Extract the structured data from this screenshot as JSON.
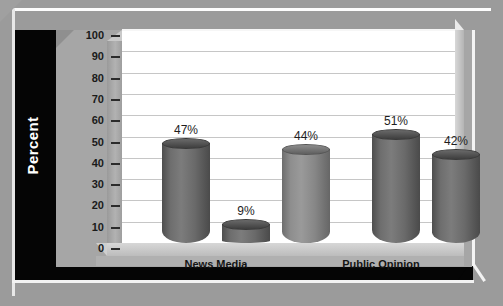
{
  "chart_data": {
    "type": "bar",
    "title": "",
    "xlabel": "",
    "ylabel": "Percent",
    "ylim": [
      0,
      100
    ],
    "yticks": [
      100,
      90,
      80,
      70,
      60,
      50,
      40,
      30,
      20,
      10,
      0
    ],
    "grid": true,
    "legend": "none",
    "categories": [
      "News Media",
      "Public Opinion"
    ],
    "bars": [
      {
        "value": 47,
        "label": "47%",
        "group": "News Media",
        "shade": "dark"
      },
      {
        "value": 9,
        "label": "9%",
        "group": "News Media",
        "shade": "dark"
      },
      {
        "value": 44,
        "label": "44%",
        "group": "News Media",
        "shade": "light"
      },
      {
        "value": 51,
        "label": "51%",
        "group": "Public Opinion",
        "shade": "dark"
      },
      {
        "value": 42,
        "label": "42%",
        "group": "Public Opinion",
        "shade": "dark"
      }
    ]
  },
  "axis": {
    "y_title": "Percent",
    "ticks": [
      "100",
      "90",
      "80",
      "70",
      "60",
      "50",
      "40",
      "30",
      "20",
      "10",
      "0"
    ]
  },
  "categories": {
    "first": "News Media",
    "second": "Public Opinion"
  },
  "bar_labels": {
    "b1": "47%",
    "b2": "9%",
    "b3": "44%",
    "b4": "51%",
    "b5": "42%"
  },
  "colors": {
    "background": "#9b9b9b",
    "band": "#050505",
    "plot_bg": "#ffffff",
    "gridline": "#c6c6c6",
    "bar_dark": "#6e6e6e",
    "bar_light": "#919191",
    "floor": "#c4c4c4",
    "axis_text": "#1a1a1a",
    "band_text": "#ffffff"
  }
}
